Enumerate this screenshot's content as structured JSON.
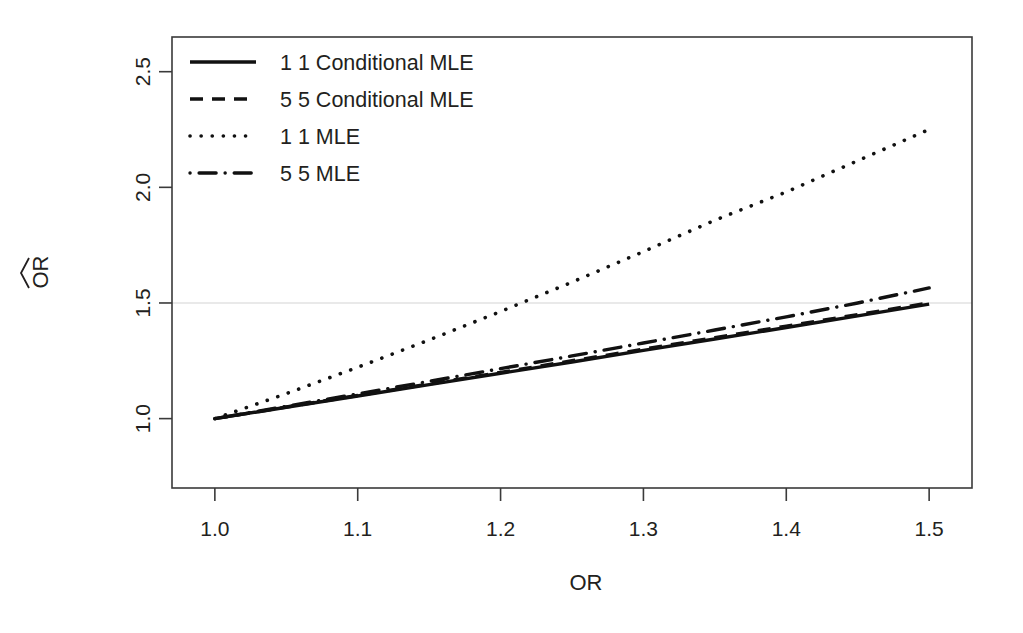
{
  "chart_data": {
    "type": "line",
    "title": "",
    "xlabel": "OR",
    "ylabel": "OR̂",
    "xlim": [
      0.97,
      1.53
    ],
    "ylim": [
      0.7,
      2.65
    ],
    "xticks": [
      "1.0",
      "1.1",
      "1.2",
      "1.3",
      "1.4",
      "1.5"
    ],
    "xtick_values": [
      1.0,
      1.1,
      1.2,
      1.3,
      1.4,
      1.5
    ],
    "yticks": [
      "1.0",
      "1.5",
      "2.0",
      "2.5"
    ],
    "ytick_values": [
      1.0,
      1.5,
      2.0,
      2.5
    ],
    "grid": false,
    "reference_lines": [
      {
        "axis": "y",
        "value": 1.5,
        "color": "#e9e9e9"
      }
    ],
    "legend_position": "top-left",
    "x": [
      1.0,
      1.05,
      1.1,
      1.15,
      1.2,
      1.25,
      1.3,
      1.35,
      1.4,
      1.45,
      1.5
    ],
    "series": [
      {
        "name": "1 1 Conditional MLE",
        "style": "solid",
        "color": "#111111",
        "values": [
          1.0,
          1.049,
          1.098,
          1.147,
          1.196,
          1.245,
          1.295,
          1.344,
          1.394,
          1.444,
          1.495
        ]
      },
      {
        "name": "5 5 Conditional MLE",
        "style": "dashed",
        "color": "#111111",
        "values": [
          1.0,
          1.05,
          1.1,
          1.15,
          1.2,
          1.25,
          1.3,
          1.35,
          1.4,
          1.45,
          1.5
        ]
      },
      {
        "name": "1 1 MLE",
        "style": "dotted",
        "color": "#111111",
        "values": [
          1.0,
          1.108,
          1.222,
          1.34,
          1.463,
          1.59,
          1.722,
          1.858,
          1.98,
          2.115,
          2.25
        ]
      },
      {
        "name": "5 5 MLE",
        "style": "dashdot",
        "color": "#111111",
        "values": [
          1.0,
          1.053,
          1.107,
          1.161,
          1.216,
          1.271,
          1.327,
          1.383,
          1.44,
          1.5,
          1.565
        ]
      }
    ]
  },
  "legend": {
    "entries": [
      {
        "label": "1 1 Conditional MLE",
        "style": "solid"
      },
      {
        "label": "5 5 Conditional MLE",
        "style": "dashed"
      },
      {
        "label": "1 1 MLE",
        "style": "dotted"
      },
      {
        "label": "5 5 MLE",
        "style": "dashdot"
      }
    ]
  },
  "axes": {
    "x_title": "OR",
    "y_title": "OR",
    "y_title_hat": "^"
  }
}
